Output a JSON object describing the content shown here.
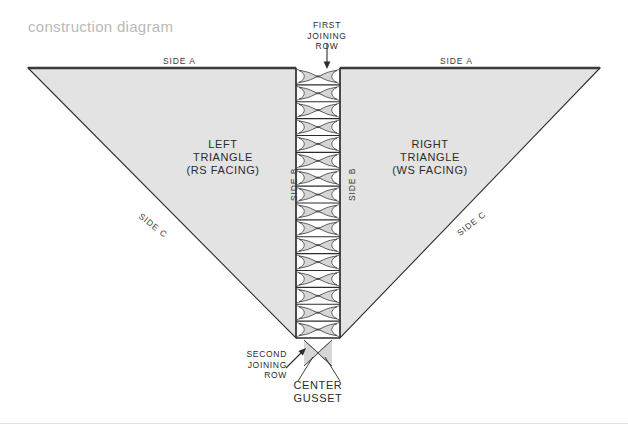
{
  "title": "construction diagram",
  "colors": {
    "triangle_fill": "#e3e3e3",
    "triangle_stroke": "#2b2b2b",
    "top_edge": "#3a3a3a",
    "cable_stroke": "#4a4a4a",
    "cable_fill": "#d6d6d6",
    "label_text": "#2b2b2b",
    "title_text": "#b9b9b9",
    "page_background": "#ffffff"
  },
  "labels": {
    "side_a_left": "SIDE A",
    "side_a_right": "SIDE A",
    "side_b_left": "SIDE B",
    "side_b_right": "SIDE B",
    "side_c_left": "SIDE C",
    "side_c_right": "SIDE C"
  },
  "regions": {
    "left_triangle": {
      "line1": "LEFT",
      "line2": "TRIANGLE",
      "line3": "(RS FACING)"
    },
    "right_triangle": {
      "line1": "RIGHT",
      "line2": "TRIANGLE",
      "line3": "(WS FACING)"
    }
  },
  "callouts": {
    "first_joining_row": {
      "line1": "FIRST",
      "line2": "JOINING",
      "line3": "ROW"
    },
    "second_joining_row": {
      "line1": "SECOND",
      "line2": "JOINING",
      "line3": "ROW"
    },
    "center_gusset": {
      "line1": "CENTER",
      "line2": "GUSSET"
    }
  },
  "geometry": {
    "left_triangle_points": "28,68 296,68 296,338 ",
    "right_triangle_points": "340,68 600,68 340,338 ",
    "column_left_x": 296,
    "column_right_x": 340,
    "column_top_y": 68,
    "column_bottom_y": 338,
    "cable_repeats": 16
  }
}
